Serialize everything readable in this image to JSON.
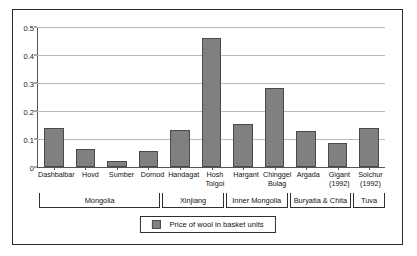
{
  "chart_data": {
    "type": "bar",
    "title": "",
    "subtitle": "",
    "xlabel": "",
    "ylabel": "",
    "ylim": [
      0,
      0.5
    ],
    "yticks": [
      "0",
      "0.1",
      "0.2",
      "0.3",
      "0.4",
      "0.5"
    ],
    "ytick_values": [
      0,
      0.1,
      0.2,
      0.3,
      0.4,
      0.5
    ],
    "grid": true,
    "legend_position": "bottom",
    "legend": [
      "Price of wool in basket units"
    ],
    "categories": [
      "Dashbalbar",
      "Hovd",
      "Sumber",
      "Dornod",
      "Handagat",
      "Hosh\nTolgoi",
      "Hargant",
      "Chinggel\nBulag",
      "Argada",
      "Gigant\n(1992)",
      "Solchur\n(1992)"
    ],
    "values": [
      0.14,
      0.065,
      0.023,
      0.059,
      0.134,
      0.463,
      0.156,
      0.286,
      0.13,
      0.086,
      0.14
    ],
    "series": [
      {
        "name": "Price of wool in basket units",
        "values": [
          0.14,
          0.065,
          0.023,
          0.059,
          0.134,
          0.463,
          0.156,
          0.286,
          0.13,
          0.086,
          0.14
        ],
        "color": "#808080"
      }
    ],
    "groups": [
      {
        "label": "Mongolia",
        "span": 4
      },
      {
        "label": "Xinjiang",
        "span": 2
      },
      {
        "label": "Inner Mongolia",
        "span": 2
      },
      {
        "label": "Buryatia & Chita",
        "span": 2
      },
      {
        "label": "Tuva",
        "span": 1
      }
    ],
    "colors": {
      "bar_fill": "#808080",
      "bar_border": "#4a4a4a",
      "gridline": "#b9b9b9",
      "axis": "#555555",
      "frame": "#2b2b2b",
      "text": "#111111"
    }
  }
}
